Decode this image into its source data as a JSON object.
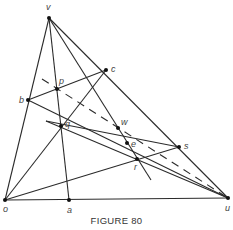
{
  "caption": "FIGURE 80",
  "points": {
    "v": {
      "label": "v",
      "x": 49,
      "y": 18
    },
    "o": {
      "label": "o",
      "x": 5,
      "y": 200
    },
    "u": {
      "label": "u",
      "x": 228,
      "y": 198
    },
    "a": {
      "label": "a",
      "x": 69,
      "y": 200
    },
    "b": {
      "label": "b",
      "x": 28,
      "y": 100
    },
    "c": {
      "label": "c",
      "x": 106,
      "y": 70
    },
    "p": {
      "label": "p",
      "x": 57,
      "y": 89
    },
    "q": {
      "label": "q",
      "x": 61,
      "y": 126
    },
    "w": {
      "label": "w",
      "x": 118,
      "y": 128
    },
    "e": {
      "label": "e",
      "x": 127,
      "y": 143
    },
    "r": {
      "label": "r",
      "x": 137,
      "y": 159
    },
    "s": {
      "label": "s",
      "x": 179,
      "y": 147
    }
  }
}
